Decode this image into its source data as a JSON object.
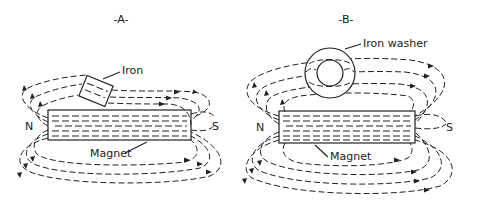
{
  "figures": [
    {
      "id": "A",
      "title": "-A-",
      "labels": {
        "object": "Iron",
        "magnet": "Magnet",
        "north": "N",
        "south": "S"
      }
    },
    {
      "id": "B",
      "title": "-B-",
      "labels": {
        "object": "Iron washer",
        "magnet": "Magnet",
        "north": "N",
        "south": "S"
      }
    }
  ],
  "colors": {
    "ink": "#222222",
    "background": "#ffffff"
  }
}
